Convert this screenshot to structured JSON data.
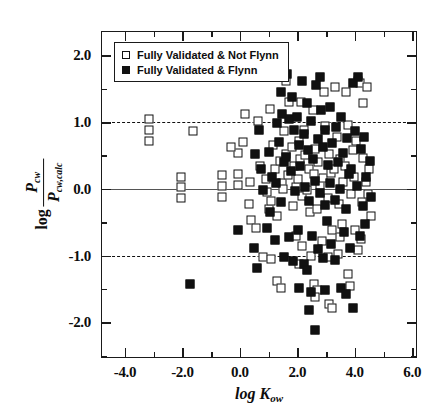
{
  "chart_data": {
    "type": "scatter",
    "title": "",
    "xlabel": "log K_ow",
    "ylabel": "log (P_cw / P_cw,calc)",
    "xlim": [
      -4.8,
      6.2
    ],
    "ylim": [
      -2.55,
      2.35
    ],
    "xticks": [
      "-4.0",
      "-2.0",
      "0.0",
      "2.0",
      "4.0",
      "6.0"
    ],
    "xtick_values": [
      -4.0,
      -2.0,
      0.0,
      2.0,
      4.0,
      6.0
    ],
    "yticks": [
      "2.0",
      "1.0",
      "0.0",
      "-1.0",
      "-2.0"
    ],
    "ytick_values": [
      2.0,
      1.0,
      0.0,
      -1.0,
      -2.0
    ],
    "grid": false,
    "minor_ticks": true,
    "reference_lines": [
      {
        "y": 1.0,
        "style": "dashed"
      },
      {
        "y": 0.0,
        "style": "solid"
      },
      {
        "y": -1.0,
        "style": "dashed"
      }
    ],
    "legend_position": "top-left",
    "series": [
      {
        "name": "Fully Validated & Not Flynn",
        "marker": "open-square",
        "points": [
          [
            -3.15,
            1.05
          ],
          [
            -3.15,
            0.88
          ],
          [
            -3.15,
            0.72
          ],
          [
            -2.05,
            0.18
          ],
          [
            -2.05,
            0.02
          ],
          [
            -2.05,
            -0.14
          ],
          [
            -1.62,
            0.86
          ],
          [
            -0.62,
            0.2
          ],
          [
            -0.62,
            0.04
          ],
          [
            -0.62,
            -0.12
          ],
          [
            -0.05,
            0.54
          ],
          [
            -0.05,
            0.22
          ],
          [
            -0.05,
            0.06
          ],
          [
            0.35,
            0.1
          ],
          [
            0.3,
            -0.22
          ],
          [
            0.38,
            -0.46
          ],
          [
            0.62,
            1.02
          ],
          [
            0.7,
            0.34
          ],
          [
            0.55,
            -0.58
          ],
          [
            0.9,
            0.14
          ],
          [
            0.95,
            -0.05
          ],
          [
            1.0,
            -0.3
          ],
          [
            1.15,
            0.66
          ],
          [
            1.22,
            0.3
          ],
          [
            1.1,
            -0.18
          ],
          [
            1.38,
            0.42
          ],
          [
            1.45,
            0.08
          ],
          [
            1.3,
            -0.4
          ],
          [
            1.55,
            0.86
          ],
          [
            1.62,
            0.52
          ],
          [
            1.5,
            0.0
          ],
          [
            1.72,
            1.3
          ],
          [
            1.8,
            0.62
          ],
          [
            1.68,
            0.2
          ],
          [
            1.88,
            0.34
          ],
          [
            1.95,
            0.02
          ],
          [
            1.85,
            -0.26
          ],
          [
            2.05,
            0.72
          ],
          [
            2.1,
            0.44
          ],
          [
            2.02,
            0.14
          ],
          [
            2.22,
            0.88
          ],
          [
            2.28,
            0.5
          ],
          [
            2.15,
            -0.1
          ],
          [
            2.4,
            0.3
          ],
          [
            2.35,
            -0.02
          ],
          [
            2.45,
            -0.35
          ],
          [
            2.55,
            1.18
          ],
          [
            2.62,
            0.6
          ],
          [
            2.58,
            0.22
          ],
          [
            2.72,
            0.4
          ],
          [
            2.8,
            0.06
          ],
          [
            2.68,
            -0.3
          ],
          [
            2.92,
            1.45
          ],
          [
            2.98,
            0.94
          ],
          [
            2.88,
            0.16
          ],
          [
            3.1,
            0.52
          ],
          [
            3.18,
            0.24
          ],
          [
            3.05,
            -0.14
          ],
          [
            3.32,
            1.52
          ],
          [
            3.38,
            0.78
          ],
          [
            3.28,
            0.3
          ],
          [
            3.5,
            0.44
          ],
          [
            3.58,
            0.1
          ],
          [
            3.45,
            -0.22
          ],
          [
            3.7,
            1.45
          ],
          [
            3.78,
            0.96
          ],
          [
            3.65,
            0.34
          ],
          [
            3.92,
            0.58
          ],
          [
            3.98,
            0.18
          ],
          [
            3.88,
            -0.08
          ],
          [
            4.1,
            1.62
          ],
          [
            4.18,
            1.58
          ],
          [
            4.05,
            0.72
          ],
          [
            4.3,
            0.46
          ],
          [
            4.38,
            0.1
          ],
          [
            4.25,
            -0.2
          ],
          [
            4.5,
            0.3
          ],
          [
            4.45,
            -0.08
          ],
          [
            4.55,
            -0.4
          ],
          [
            0.82,
            -1.02
          ],
          [
            1.08,
            -1.05
          ],
          [
            2.05,
            -1.12
          ],
          [
            2.48,
            -1.0
          ],
          [
            3.05,
            -1.02
          ],
          [
            3.42,
            -0.98
          ],
          [
            1.3,
            -1.38
          ],
          [
            1.42,
            -1.48
          ],
          [
            2.58,
            -1.42
          ],
          [
            2.7,
            -1.52
          ],
          [
            2.62,
            -1.62
          ],
          [
            3.78,
            -1.28
          ],
          [
            3.85,
            -1.45
          ],
          [
            3.5,
            -0.72
          ],
          [
            3.55,
            -0.52
          ],
          [
            3.2,
            -0.62
          ],
          [
            1.95,
            -0.7
          ],
          [
            2.15,
            -0.86
          ],
          [
            2.85,
            -0.78
          ],
          [
            4.02,
            -0.62
          ],
          [
            4.12,
            -0.92
          ],
          [
            4.2,
            -0.75
          ],
          [
            3.1,
            -1.72
          ],
          [
            3.22,
            -1.78
          ],
          [
            -0.32,
            0.62
          ],
          [
            0.12,
            0.7
          ],
          [
            0.18,
            1.12
          ],
          [
            1.05,
            1.2
          ],
          [
            1.62,
            1.62
          ],
          [
            2.12,
            1.3
          ],
          [
            4.42,
            1.52
          ],
          [
            4.28,
            1.28
          ]
        ]
      },
      {
        "name": "Fully Validated & Flynn",
        "marker": "filled-square",
        "points": [
          [
            -1.72,
            -1.42
          ],
          [
            -0.08,
            -0.62
          ],
          [
            0.48,
            -0.88
          ],
          [
            0.58,
            -1.18
          ],
          [
            0.75,
            0.3
          ],
          [
            0.82,
            -0.02
          ],
          [
            1.02,
            0.55
          ],
          [
            1.12,
            0.18
          ],
          [
            1.05,
            -0.35
          ],
          [
            1.28,
            0.98
          ],
          [
            1.35,
            0.7
          ],
          [
            1.25,
            0.08
          ],
          [
            1.48,
            1.12
          ],
          [
            1.55,
            0.4
          ],
          [
            1.42,
            -0.2
          ],
          [
            1.65,
            1.72
          ],
          [
            1.7,
            1.05
          ],
          [
            1.6,
            0.48
          ],
          [
            1.82,
            1.38
          ],
          [
            1.88,
            0.88
          ],
          [
            1.78,
            0.26
          ],
          [
            1.98,
            1.08
          ],
          [
            2.05,
            0.66
          ],
          [
            1.92,
            -0.04
          ],
          [
            2.15,
            1.62
          ],
          [
            2.22,
            0.82
          ],
          [
            2.1,
            0.34
          ],
          [
            2.32,
            1.28
          ],
          [
            2.38,
            0.58
          ],
          [
            2.28,
            0.02
          ],
          [
            2.48,
            1.02
          ],
          [
            2.55,
            0.44
          ],
          [
            2.42,
            -0.18
          ],
          [
            2.65,
            1.55
          ],
          [
            2.72,
            0.74
          ],
          [
            2.6,
            0.12
          ],
          [
            2.82,
            1.18
          ],
          [
            2.88,
            0.62
          ],
          [
            2.78,
            -0.06
          ],
          [
            2.98,
            0.88
          ],
          [
            3.05,
            0.36
          ],
          [
            2.95,
            -0.24
          ],
          [
            3.15,
            1.22
          ],
          [
            3.22,
            0.68
          ],
          [
            3.12,
            0.08
          ],
          [
            3.35,
            0.92
          ],
          [
            3.42,
            0.4
          ],
          [
            3.3,
            -0.16
          ],
          [
            3.52,
            1.08
          ],
          [
            3.6,
            0.54
          ],
          [
            3.48,
            0.0
          ],
          [
            3.72,
            0.76
          ],
          [
            3.8,
            0.22
          ],
          [
            3.68,
            -0.3
          ],
          [
            3.92,
            1.58
          ],
          [
            4.0,
            0.86
          ],
          [
            3.88,
            0.3
          ],
          [
            4.12,
            1.68
          ],
          [
            4.2,
            0.6
          ],
          [
            4.08,
            0.04
          ],
          [
            4.32,
            0.78
          ],
          [
            4.4,
            0.18
          ],
          [
            4.28,
            -0.26
          ],
          [
            4.52,
            0.42
          ],
          [
            4.58,
            -0.12
          ],
          [
            1.52,
            -1.02
          ],
          [
            1.85,
            -1.08
          ],
          [
            2.22,
            -1.12
          ],
          [
            2.35,
            -1.22
          ],
          [
            2.88,
            -1.04
          ],
          [
            3.32,
            -1.06
          ],
          [
            2.05,
            -1.48
          ],
          [
            2.48,
            -1.55
          ],
          [
            2.95,
            -1.52
          ],
          [
            3.52,
            -1.48
          ],
          [
            3.68,
            -1.58
          ],
          [
            2.42,
            -1.82
          ],
          [
            2.62,
            -2.12
          ],
          [
            3.95,
            -1.78
          ],
          [
            1.72,
            -0.72
          ],
          [
            2.02,
            -0.62
          ],
          [
            2.52,
            -0.7
          ],
          [
            2.72,
            -0.9
          ],
          [
            3.18,
            -0.82
          ],
          [
            3.62,
            -0.64
          ],
          [
            3.85,
            -0.88
          ],
          [
            4.18,
            -0.7
          ],
          [
            4.35,
            -0.52
          ],
          [
            0.95,
            -0.58
          ],
          [
            1.22,
            -0.76
          ],
          [
            3.02,
            -0.48
          ],
          [
            1.42,
            1.45
          ],
          [
            2.78,
            1.68
          ],
          [
            0.68,
            0.88
          ],
          [
            0.52,
            0.52
          ]
        ]
      }
    ]
  },
  "legend": {
    "items": [
      {
        "label": "Fully Validated & Not Flynn",
        "marker": "open-square"
      },
      {
        "label": "Fully Validated & Flynn",
        "marker": "filled-square"
      }
    ]
  },
  "axes": {
    "x_title_main": "log K",
    "x_title_sub": "ow",
    "y_title_log": "log",
    "y_title_numerator_main": "P",
    "y_title_numerator_sub": "cw",
    "y_title_denominator_main": "P",
    "y_title_denominator_sub": "cw,calc"
  },
  "colors": {
    "marker_stroke": "#111111",
    "marker_fill_open": "#ffffff",
    "marker_fill_closed": "#111111",
    "axis": "#1a1a1a",
    "reference_dashed": "#111111",
    "reference_solid": "#555555",
    "background": "#ffffff"
  }
}
